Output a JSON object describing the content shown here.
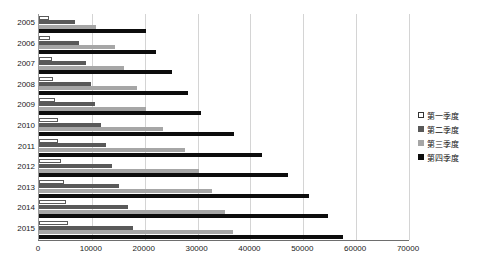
{
  "chart_data": {
    "type": "bar",
    "title": "",
    "xlabel": "",
    "ylabel": "",
    "orientation": "horizontal",
    "grid": true,
    "legend_position": "right",
    "xlim": [
      0,
      70000
    ],
    "xticks": [
      "0",
      "10000",
      "20000",
      "30000",
      "40000",
      "50000",
      "60000",
      "70000"
    ],
    "categories": [
      "2005",
      "2006",
      "2007",
      "2008",
      "2009",
      "2010",
      "2011",
      "2012",
      "2013",
      "2014",
      "2015"
    ],
    "series": [
      {
        "name": "第一季度",
        "color": "#ffffff",
        "values": [
          1900,
          2100,
          2500,
          2700,
          3000,
          3500,
          3600,
          4200,
          4700,
          5100,
          5500
        ]
      },
      {
        "name": "第二季度",
        "color": "#595959",
        "values": [
          6800,
          7600,
          8900,
          9800,
          10600,
          11700,
          12700,
          13800,
          15100,
          16800,
          17800
        ]
      },
      {
        "name": "第三季度",
        "color": "#a6a6a6",
        "values": [
          10700,
          14400,
          16100,
          18500,
          20200,
          23500,
          27600,
          30300,
          32700,
          35200,
          36700
        ]
      },
      {
        "name": "第四季度",
        "color": "#0d0d0d",
        "values": [
          20200,
          22100,
          25100,
          28200,
          30600,
          36900,
          42200,
          47100,
          51100,
          54700,
          57500
        ]
      }
    ]
  },
  "legend": {
    "items": [
      {
        "label": "第一季度",
        "key": "q1"
      },
      {
        "label": "第二季度",
        "key": "q2"
      },
      {
        "label": "第三季度",
        "key": "q3"
      },
      {
        "label": "第四季度",
        "key": "q4"
      }
    ]
  }
}
